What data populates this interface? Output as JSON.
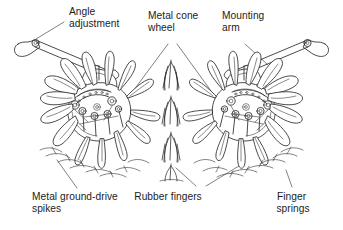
{
  "figure": {
    "background_color": "#ffffff",
    "ink_color": "#2b2b2b",
    "leader_color": "#4a4a4a"
  },
  "labels": {
    "angle_adjustment": {
      "line1": "Angle",
      "line2": "adjustment"
    },
    "metal_cone_wheel": {
      "line1": "Metal cone",
      "line2": "wheel"
    },
    "mounting_arm": {
      "line1": "Mounting",
      "line2": "arm"
    },
    "metal_ground_drive_spikes": {
      "line1": "Metal ground-drive",
      "line2": "spikes"
    },
    "rubber_fingers": {
      "line1": "Rubber fingers",
      "line2": ""
    },
    "finger_springs": {
      "line1": "Finger",
      "line2": "springs"
    }
  },
  "parts": {
    "left_wheel": "metal-cone-wheel-left",
    "right_wheel": "metal-cone-wheel-right",
    "left_arm": "mounting-arm-left",
    "right_arm": "mounting-arm-right",
    "center_crop": "grass-tuft"
  }
}
